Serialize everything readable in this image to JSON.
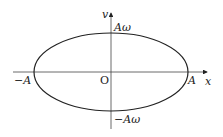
{
  "diagram": {
    "axes": {
      "x_label": "x",
      "y_label": "v",
      "origin_label": "O"
    },
    "labels": {
      "pos_x_intercept": "A",
      "neg_x_intercept": "−A",
      "pos_y_intercept": "Aω",
      "neg_y_intercept": "−Aω"
    },
    "colors": {
      "stroke": "#222222",
      "background": "#ffffff"
    }
  }
}
